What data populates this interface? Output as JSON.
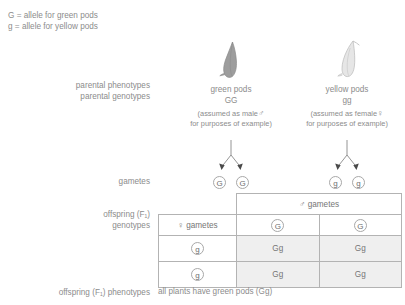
{
  "key": {
    "line1": "G = allele for green pods",
    "line2": "g = allele for yellow pods"
  },
  "labels": {
    "parental_phenotypes": "parental phenotypes",
    "parental_genotypes": "parental genotypes",
    "gametes": "gametes",
    "offspring_f1": "offspring (F₁)",
    "genotypes": "genotypes",
    "offspring_f1_phenotypes": "offspring (F₁) phenotypes"
  },
  "parents": {
    "male": {
      "phenotype": "green pods",
      "genotype": "GG",
      "note_line1": "(assumed as male",
      "sex_symbol": "♂",
      "note_line2": "for purposes of example)",
      "pod_color": "#9d9d9d",
      "gametes": [
        "G",
        "G"
      ]
    },
    "female": {
      "phenotype": "yellow pods",
      "genotype": "gg",
      "note_line1": "(assumed as female",
      "sex_symbol": "♀",
      "note_line2": "for purposes of example)",
      "pod_color": "#e2e2e2",
      "gametes": [
        "g",
        "g"
      ]
    }
  },
  "punnett": {
    "male_header": "gametes",
    "male_symbol": "♂",
    "female_header": "gametes",
    "female_symbol": "♀",
    "column_gametes": [
      "G",
      "G"
    ],
    "row_gametes": [
      "g",
      "g"
    ],
    "cells": [
      [
        "Gg",
        "Gg"
      ],
      [
        "Gg",
        "Gg"
      ]
    ],
    "cell_fill": "#efefef",
    "border_color": "#b3b3b3"
  },
  "conclusion": "all plants have green pods (Gg)",
  "colors": {
    "text": "#8c8c8c",
    "line": "#a8a8a8"
  }
}
